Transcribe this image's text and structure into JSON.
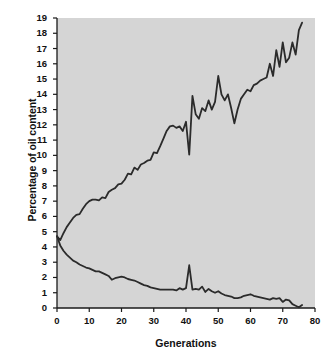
{
  "chart_data": {
    "type": "line",
    "title": "",
    "xlabel": "Generations",
    "ylabel": "Percentage of oil content",
    "xlim": [
      0,
      80
    ],
    "ylim": [
      0,
      19
    ],
    "xticks": [
      0,
      10,
      20,
      30,
      40,
      50,
      60,
      70,
      80
    ],
    "xtick_labels": [
      "0",
      "10",
      "20",
      "30",
      "40",
      "50",
      "60",
      "70",
      "80"
    ],
    "yticks": [
      0,
      1,
      2,
      3,
      4,
      5,
      6,
      7,
      8,
      9,
      10,
      11,
      12,
      13,
      14,
      15,
      16,
      17,
      18,
      19
    ],
    "ytick_labels": [
      "0",
      "1",
      "2",
      "3",
      "4",
      "5",
      "6",
      "7",
      "8",
      "9",
      "10",
      "11",
      "12",
      "13",
      "14",
      "15",
      "16",
      "17",
      "18",
      "19"
    ],
    "grid": false,
    "legend_position": "none",
    "plot_background_color": "#d5d5d5",
    "line_color": "#2b2b2b",
    "series": [
      {
        "name": "High oil selection",
        "x": [
          0,
          1,
          2,
          3,
          4,
          5,
          6,
          7,
          8,
          9,
          10,
          11,
          12,
          13,
          14,
          15,
          16,
          17,
          18,
          19,
          20,
          21,
          22,
          23,
          24,
          25,
          26,
          27,
          28,
          29,
          30,
          31,
          32,
          33,
          34,
          35,
          36,
          37,
          38,
          39,
          40,
          41,
          42,
          43,
          44,
          45,
          46,
          47,
          48,
          49,
          50,
          51,
          52,
          53,
          54,
          55,
          56,
          57,
          58,
          59,
          60,
          61,
          62,
          63,
          64,
          65,
          66,
          67,
          68,
          69,
          70,
          71,
          72,
          73,
          74,
          75,
          76
        ],
        "values": [
          4.7,
          4.45,
          4.9,
          5.3,
          5.6,
          5.9,
          6.1,
          6.15,
          6.5,
          6.8,
          7.0,
          7.1,
          7.1,
          7.05,
          7.25,
          7.2,
          7.6,
          7.75,
          7.85,
          8.1,
          8.15,
          8.4,
          8.8,
          8.75,
          9.2,
          9.05,
          9.4,
          9.5,
          9.65,
          9.7,
          10.2,
          10.15,
          10.6,
          11.1,
          11.6,
          11.9,
          11.95,
          11.8,
          11.9,
          11.6,
          12.2,
          10.05,
          13.9,
          12.7,
          12.4,
          13.1,
          12.9,
          13.6,
          13.0,
          13.5,
          15.2,
          14.0,
          13.6,
          14.0,
          13.1,
          12.1,
          13.0,
          13.7,
          14.0,
          14.3,
          14.2,
          14.6,
          14.7,
          14.9,
          15.0,
          15.1,
          16.0,
          15.2,
          16.9,
          15.8,
          17.4,
          16.1,
          16.4,
          17.4,
          16.6,
          18.2,
          18.7
        ]
      },
      {
        "name": "Low oil selection",
        "x": [
          0,
          1,
          2,
          3,
          4,
          5,
          6,
          7,
          8,
          9,
          10,
          11,
          12,
          13,
          14,
          15,
          16,
          17,
          18,
          19,
          20,
          21,
          22,
          23,
          24,
          25,
          26,
          27,
          28,
          29,
          30,
          31,
          32,
          33,
          34,
          35,
          36,
          37,
          38,
          39,
          40,
          41,
          42,
          43,
          44,
          45,
          46,
          47,
          48,
          49,
          50,
          51,
          52,
          53,
          54,
          55,
          56,
          57,
          58,
          59,
          60,
          61,
          62,
          63,
          64,
          65,
          66,
          67,
          68,
          69,
          70,
          71,
          72,
          73,
          74,
          75,
          76
        ],
        "values": [
          4.7,
          4.1,
          3.75,
          3.5,
          3.3,
          3.1,
          3.0,
          2.85,
          2.75,
          2.65,
          2.6,
          2.5,
          2.4,
          2.4,
          2.3,
          2.2,
          2.1,
          1.85,
          1.95,
          2.0,
          2.05,
          2.0,
          1.9,
          1.85,
          1.8,
          1.7,
          1.6,
          1.5,
          1.45,
          1.35,
          1.3,
          1.25,
          1.2,
          1.2,
          1.2,
          1.2,
          1.2,
          1.15,
          1.3,
          1.2,
          1.3,
          2.8,
          1.2,
          1.25,
          1.2,
          1.4,
          1.05,
          1.25,
          1.1,
          1.0,
          1.1,
          0.95,
          0.85,
          0.8,
          0.75,
          0.65,
          0.65,
          0.7,
          0.8,
          0.85,
          0.9,
          0.8,
          0.75,
          0.7,
          0.65,
          0.6,
          0.55,
          0.65,
          0.6,
          0.65,
          0.4,
          0.55,
          0.5,
          0.25,
          0.15,
          0.05,
          0.2
        ]
      }
    ]
  },
  "axes": {
    "plot_left_px": 57,
    "plot_right_px": 315,
    "plot_top_px": 18,
    "plot_bottom_px": 308
  }
}
